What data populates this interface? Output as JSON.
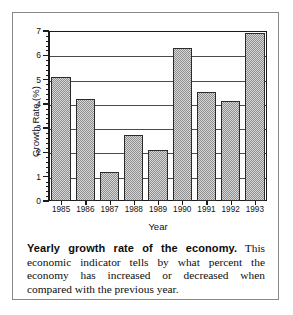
{
  "chart_data": {
    "type": "bar",
    "title": "",
    "xlabel": "Year",
    "ylabel": "Growth Rate (%)",
    "categories": [
      "1985",
      "1986",
      "1987",
      "1988",
      "1989",
      "1990",
      "1991",
      "1992",
      "1993"
    ],
    "values": [
      5.1,
      4.2,
      1.2,
      2.7,
      2.1,
      6.3,
      4.5,
      4.1,
      6.9
    ],
    "ylim": [
      0,
      7
    ],
    "ytick_labels": [
      "0",
      "1",
      "2",
      "3",
      "4",
      "5",
      "6",
      "7"
    ],
    "ytick_values": [
      0,
      1,
      2,
      3,
      4,
      5,
      6,
      7
    ],
    "minor_ticks_per_interval": 4,
    "grid": "horizontal",
    "legend": "none",
    "bar_fill": "crosshatch-dither",
    "colors": {
      "bar_fill": "#d7d7d7",
      "bar_pattern": "#8f8f8f",
      "bar_edge": "#2b2b2b",
      "axis": "#1a1a1a",
      "gridline": "#4a4a4a",
      "text": "#111111",
      "figure_border": "#8a8a8a"
    }
  },
  "caption": {
    "lead": "Yearly growth rate of the economy.",
    "body": " This economic indicator tells by what percent the economy has increased or decreased when compared with the previous year."
  }
}
